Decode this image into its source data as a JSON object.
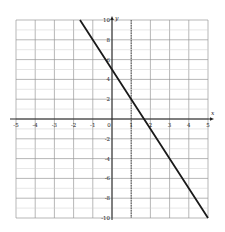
{
  "chart_data": {
    "type": "line",
    "title": "",
    "xlabel": "x",
    "ylabel": "y",
    "xlim": [
      -5,
      5
    ],
    "ylim": [
      -10,
      10
    ],
    "grid": true,
    "x_ticks": [
      "-5",
      "-4",
      "-3",
      "-2",
      "-1",
      "0",
      "1",
      "2",
      "3",
      "4",
      "5"
    ],
    "y_ticks": [
      "10",
      "8",
      "6",
      "4",
      "2",
      "-2",
      "-4",
      "-6",
      "-8",
      "-10"
    ],
    "series": [
      {
        "name": "y = -3x + 5",
        "x": [
          -1.667,
          0,
          1,
          1.667,
          5
        ],
        "y": [
          10,
          5,
          2,
          0,
          -10
        ],
        "color": "#1a1a1a"
      }
    ],
    "annotations": [
      {
        "type": "vertical-dashed-line",
        "x": 1
      }
    ]
  }
}
